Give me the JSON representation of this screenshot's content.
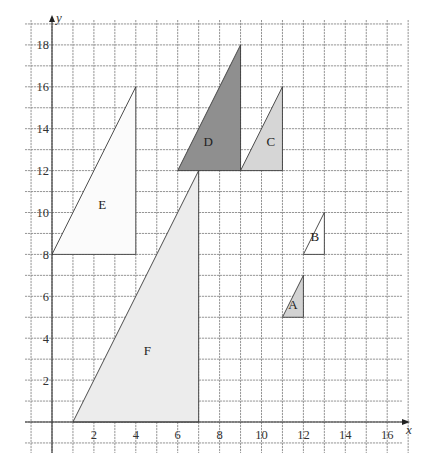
{
  "chart_data": {
    "type": "diagram",
    "title": "",
    "xlabel": "x",
    "ylabel": "y",
    "xlim": [
      -1,
      17
    ],
    "ylim": [
      -1,
      19
    ],
    "grid": true,
    "x_ticks": [
      2,
      4,
      6,
      8,
      10,
      12,
      14,
      16
    ],
    "y_ticks": [
      2,
      4,
      6,
      8,
      10,
      12,
      14,
      16,
      18
    ],
    "shapes": [
      {
        "label": "A",
        "type": "right-triangle",
        "vertices": [
          [
            11,
            5
          ],
          [
            12,
            5
          ],
          [
            12,
            7
          ]
        ],
        "fill": "#d2d2d2",
        "label_pos": [
          11.5,
          5.6
        ]
      },
      {
        "label": "B",
        "type": "right-triangle",
        "vertices": [
          [
            12,
            8
          ],
          [
            13,
            8
          ],
          [
            13,
            10
          ]
        ],
        "fill": "#ffffff",
        "label_pos": [
          12.55,
          8.85
        ]
      },
      {
        "label": "C",
        "type": "right-triangle",
        "vertices": [
          [
            9,
            12
          ],
          [
            11,
            12
          ],
          [
            11,
            16
          ]
        ],
        "fill": "#d6d6d6",
        "label_pos": [
          10.45,
          13.4
        ]
      },
      {
        "label": "D",
        "type": "right-triangle",
        "vertices": [
          [
            6,
            12
          ],
          [
            9,
            12
          ],
          [
            9,
            18
          ]
        ],
        "fill": "#8f8f8f",
        "label_pos": [
          7.45,
          13.4
        ]
      },
      {
        "label": "E",
        "type": "right-triangle",
        "vertices": [
          [
            0,
            8
          ],
          [
            4,
            8
          ],
          [
            4,
            16
          ]
        ],
        "fill": "#fbfbfb",
        "label_pos": [
          2.4,
          10.4
        ]
      },
      {
        "label": "F",
        "type": "right-triangle",
        "vertices": [
          [
            1,
            0
          ],
          [
            7,
            0
          ],
          [
            7,
            12
          ]
        ],
        "fill": "#ececec",
        "label_pos": [
          4.55,
          3.4
        ]
      }
    ]
  },
  "layout": {
    "origin_px": [
      52,
      422
    ],
    "unit_px": 20.95
  },
  "colors": {
    "grid": "#8a8a8a",
    "axis": "#333333",
    "shape_stroke": "#3a3a3a",
    "text": "#333333"
  }
}
